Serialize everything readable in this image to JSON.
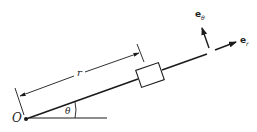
{
  "diagram": {
    "labels": {
      "origin": "O",
      "radius": "r",
      "angle": "θ",
      "unit_theta_base": "e",
      "unit_theta_sub": "θ",
      "unit_r_base": "e",
      "unit_r_sub": "r"
    },
    "colors": {
      "stroke": "#1a1a1a",
      "background": "#ffffff"
    }
  }
}
